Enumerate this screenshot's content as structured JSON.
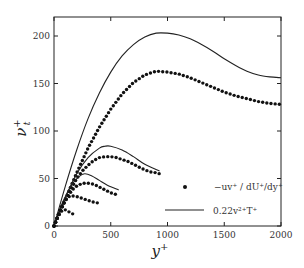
{
  "chart_data": {
    "type": "line",
    "title": "",
    "xlabel": "y+",
    "ylabel": "ν_t+",
    "xlim": [
      0,
      2000
    ],
    "ylim": [
      0,
      220
    ],
    "xticks": [
      0,
      500,
      1000,
      1500,
      2000
    ],
    "yticks": [
      0,
      50,
      100,
      150,
      200
    ],
    "grid": false,
    "legend_position": "lower right",
    "legend": [
      {
        "marker": "dot",
        "label": "−uv⁺ / (dU⁺/dy⁺)"
      },
      {
        "marker": "line",
        "label": "0.22 v²⁺ T⁺"
      }
    ],
    "series": [
      {
        "name": "dots case 1",
        "style": "dots",
        "x": [
          0,
          50,
          100,
          150,
          200,
          300,
          400,
          500,
          600,
          700,
          800,
          900,
          1000,
          1100,
          1200,
          1300,
          1400,
          1500,
          1600,
          1700,
          1800,
          1900,
          2000
        ],
        "values": [
          0,
          14,
          28,
          42,
          56,
          82,
          104,
          123,
          139,
          151,
          159,
          163,
          162,
          160,
          156,
          151,
          146,
          141,
          137,
          134,
          131,
          129,
          128
        ]
      },
      {
        "name": "line case 1",
        "style": "line",
        "x": [
          0,
          100,
          200,
          300,
          400,
          500,
          600,
          700,
          800,
          900,
          1000,
          1100,
          1200,
          1300,
          1400,
          1500,
          1600,
          1700,
          1800,
          1900,
          2000
        ],
        "values": [
          0,
          42,
          80,
          113,
          140,
          162,
          179,
          191,
          199,
          203,
          203,
          201,
          197,
          191,
          184,
          176,
          169,
          163,
          159,
          157,
          156
        ]
      },
      {
        "name": "dots case 2",
        "style": "dots",
        "x": [
          0,
          50,
          100,
          150,
          200,
          250,
          300,
          350,
          400,
          450,
          500,
          550,
          600,
          650,
          700,
          750,
          800,
          850,
          900,
          930
        ],
        "values": [
          0,
          14,
          27,
          39,
          50,
          58,
          64,
          69,
          72,
          73,
          73,
          72,
          70,
          68,
          65,
          62,
          59,
          57,
          56,
          55
        ]
      },
      {
        "name": "line case 2",
        "style": "line",
        "x": [
          0,
          100,
          200,
          300,
          400,
          450,
          500,
          600,
          700,
          800,
          930
        ],
        "values": [
          0,
          30,
          55,
          72,
          82,
          84,
          84,
          80,
          73,
          65,
          58
        ]
      },
      {
        "name": "dots case 3",
        "style": "dots",
        "x": [
          0,
          40,
          80,
          120,
          160,
          200,
          250,
          300,
          350,
          400,
          450,
          500,
          550,
          570
        ],
        "values": [
          0,
          12,
          23,
          31,
          38,
          42,
          45,
          45,
          44,
          41,
          38,
          35,
          33,
          32
        ]
      },
      {
        "name": "line case 3",
        "style": "line",
        "x": [
          0,
          80,
          160,
          220,
          270,
          330,
          400,
          470,
          570
        ],
        "values": [
          0,
          26,
          44,
          52,
          55,
          53,
          48,
          43,
          38
        ]
      },
      {
        "name": "dots case 4",
        "style": "dots",
        "x": [
          0,
          30,
          60,
          90,
          120,
          150,
          200,
          250,
          300,
          350,
          400
        ],
        "values": [
          0,
          10,
          19,
          25,
          30,
          32,
          31,
          29,
          27,
          25,
          24
        ]
      },
      {
        "name": "dots case 5",
        "style": "dots",
        "x": [
          0,
          20,
          40,
          60,
          80,
          100,
          130,
          160,
          180
        ],
        "values": [
          0,
          6,
          11,
          15,
          17,
          17,
          15,
          13,
          12
        ]
      }
    ]
  },
  "axes": {
    "x_ticks": [
      "0",
      "500",
      "1000",
      "1500",
      "2000"
    ],
    "y_ticks": [
      "0",
      "50",
      "100",
      "150",
      "200"
    ],
    "x_label": "y",
    "y_label": "ν",
    "sup": "+",
    "sub": "t"
  },
  "legend": {
    "dots_label": "−uv⁺ / dU⁺/dy⁺",
    "line_label": "0.22v²⁺T⁺"
  }
}
